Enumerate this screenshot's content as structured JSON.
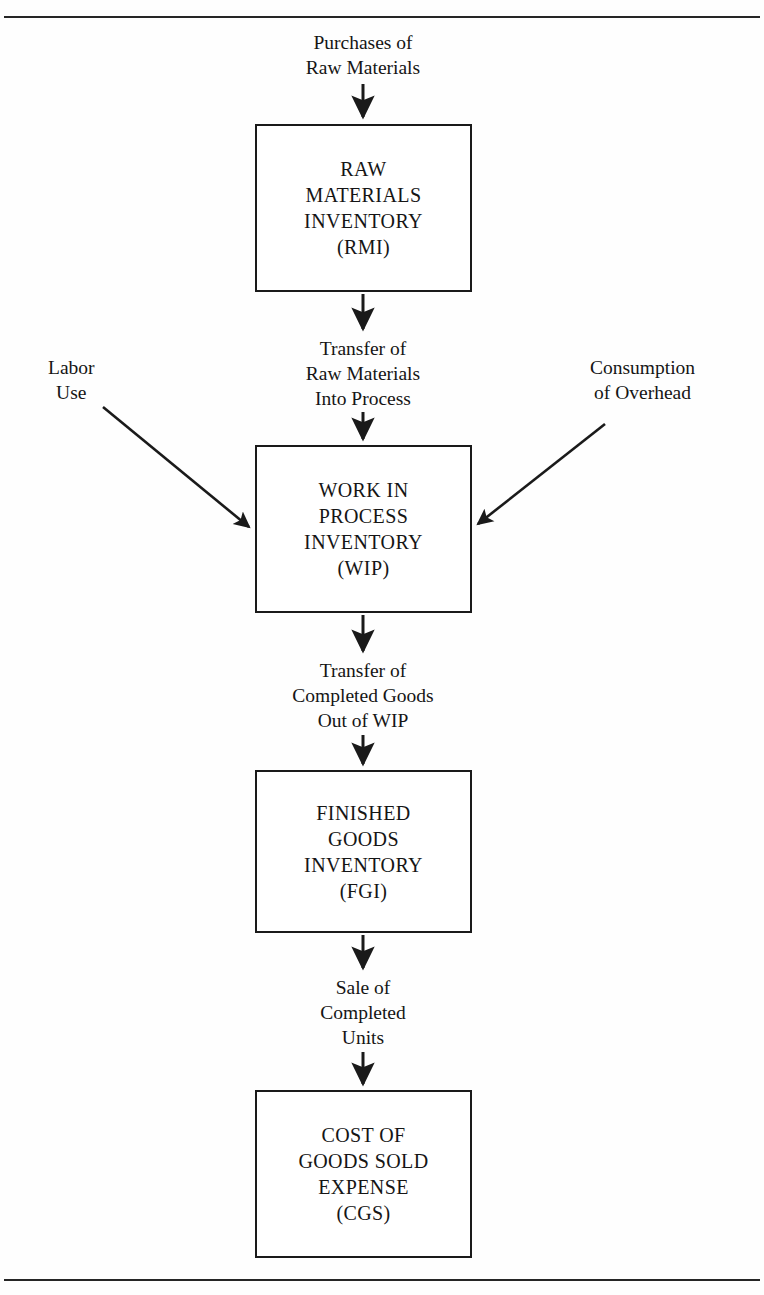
{
  "figure": {
    "type": "flowchart",
    "orientation": "vertical",
    "title": "",
    "ink_color": "#1a1a1a",
    "background_color": "#ffffff"
  },
  "nodes": [
    {
      "id": "rmi",
      "lines": [
        "RAW",
        "MATERIALS",
        "INVENTORY",
        "(RMI)"
      ]
    },
    {
      "id": "wip",
      "lines": [
        "WORK IN",
        "PROCESS",
        "INVENTORY",
        "(WIP)"
      ]
    },
    {
      "id": "fgi",
      "lines": [
        "FINISHED",
        "GOODS",
        "INVENTORY",
        "(FGI)"
      ]
    },
    {
      "id": "cgs",
      "lines": [
        "COST OF",
        "GOODS SOLD",
        "EXPENSE",
        "(CGS)"
      ]
    }
  ],
  "edge_labels": [
    {
      "id": "purchases",
      "lines": [
        "Purchases of",
        "Raw Materials"
      ]
    },
    {
      "id": "transfer-rm",
      "lines": [
        "Transfer of",
        "Raw Materials",
        "Into Process"
      ]
    },
    {
      "id": "transfer-completed",
      "lines": [
        "Transfer of",
        "Completed Goods",
        "Out of WIP"
      ]
    },
    {
      "id": "sale",
      "lines": [
        "Sale of",
        "Completed",
        "Units"
      ]
    }
  ],
  "side_inputs": [
    {
      "id": "labor-use",
      "lines": [
        "Labor",
        "Use"
      ],
      "target": "wip",
      "side": "left"
    },
    {
      "id": "consumption-overhead",
      "lines": [
        "Consumption",
        "of Overhead"
      ],
      "target": "wip",
      "side": "right"
    }
  ]
}
